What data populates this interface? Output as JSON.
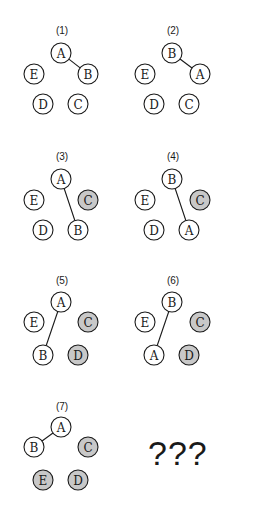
{
  "node_radius": 10,
  "colors": {
    "node_fill": "#ffffff",
    "node_fill_shaded": "#c8c8c8",
    "stroke": "#1a1a1a"
  },
  "panels": [
    {
      "label": "(1)",
      "label_pos": [
        62,
        34
      ],
      "nodes": [
        {
          "id": "A",
          "x": 61,
          "y": 53,
          "shaded": false
        },
        {
          "id": "E",
          "x": 34,
          "y": 74,
          "shaded": false
        },
        {
          "id": "B",
          "x": 88,
          "y": 74,
          "shaded": false
        },
        {
          "id": "D",
          "x": 43,
          "y": 104,
          "shaded": false
        },
        {
          "id": "C",
          "x": 78,
          "y": 104,
          "shaded": false
        }
      ],
      "edges": [
        [
          "A",
          "B"
        ]
      ]
    },
    {
      "label": "(2)",
      "label_pos": [
        173,
        34
      ],
      "nodes": [
        {
          "id": "B",
          "x": 172,
          "y": 53,
          "shaded": false
        },
        {
          "id": "E",
          "x": 145,
          "y": 74,
          "shaded": false
        },
        {
          "id": "A",
          "x": 200,
          "y": 74,
          "shaded": false
        },
        {
          "id": "D",
          "x": 154,
          "y": 104,
          "shaded": false
        },
        {
          "id": "C",
          "x": 189,
          "y": 104,
          "shaded": false
        }
      ],
      "edges": [
        [
          "B",
          "A"
        ]
      ]
    },
    {
      "label": "(3)",
      "label_pos": [
        62,
        160
      ],
      "nodes": [
        {
          "id": "A",
          "x": 61,
          "y": 179,
          "shaded": false
        },
        {
          "id": "E",
          "x": 34,
          "y": 200,
          "shaded": false
        },
        {
          "id": "C",
          "x": 88,
          "y": 200,
          "shaded": true
        },
        {
          "id": "D",
          "x": 43,
          "y": 230,
          "shaded": false
        },
        {
          "id": "B",
          "x": 78,
          "y": 230,
          "shaded": false
        }
      ],
      "edges": [
        [
          "A",
          "B"
        ]
      ]
    },
    {
      "label": "(4)",
      "label_pos": [
        173,
        160
      ],
      "nodes": [
        {
          "id": "B",
          "x": 172,
          "y": 179,
          "shaded": false
        },
        {
          "id": "E",
          "x": 145,
          "y": 200,
          "shaded": false
        },
        {
          "id": "C",
          "x": 200,
          "y": 200,
          "shaded": true
        },
        {
          "id": "D",
          "x": 154,
          "y": 230,
          "shaded": false
        },
        {
          "id": "A",
          "x": 189,
          "y": 230,
          "shaded": false
        }
      ],
      "edges": [
        [
          "B",
          "A"
        ]
      ]
    },
    {
      "label": "(5)",
      "label_pos": [
        62,
        284
      ],
      "nodes": [
        {
          "id": "A",
          "x": 61,
          "y": 302,
          "shaded": false
        },
        {
          "id": "E",
          "x": 34,
          "y": 322,
          "shaded": false
        },
        {
          "id": "C",
          "x": 88,
          "y": 322,
          "shaded": true
        },
        {
          "id": "B",
          "x": 43,
          "y": 355,
          "shaded": false
        },
        {
          "id": "D",
          "x": 78,
          "y": 355,
          "shaded": true
        }
      ],
      "edges": [
        [
          "A",
          "B"
        ]
      ]
    },
    {
      "label": "(6)",
      "label_pos": [
        173,
        284
      ],
      "nodes": [
        {
          "id": "B",
          "x": 172,
          "y": 302,
          "shaded": false
        },
        {
          "id": "E",
          "x": 145,
          "y": 322,
          "shaded": false
        },
        {
          "id": "C",
          "x": 200,
          "y": 322,
          "shaded": true
        },
        {
          "id": "A",
          "x": 154,
          "y": 355,
          "shaded": false
        },
        {
          "id": "D",
          "x": 189,
          "y": 355,
          "shaded": true
        }
      ],
      "edges": [
        [
          "B",
          "A"
        ]
      ]
    },
    {
      "label": "(7)",
      "label_pos": [
        62,
        410
      ],
      "nodes": [
        {
          "id": "A",
          "x": 61,
          "y": 427,
          "shaded": false
        },
        {
          "id": "B",
          "x": 34,
          "y": 447,
          "shaded": false
        },
        {
          "id": "C",
          "x": 88,
          "y": 447,
          "shaded": true
        },
        {
          "id": "E",
          "x": 43,
          "y": 480,
          "shaded": true
        },
        {
          "id": "D",
          "x": 78,
          "y": 480,
          "shaded": true
        }
      ],
      "edges": [
        [
          "A",
          "B"
        ]
      ]
    }
  ],
  "unknown_panel": {
    "text": "???"
  }
}
